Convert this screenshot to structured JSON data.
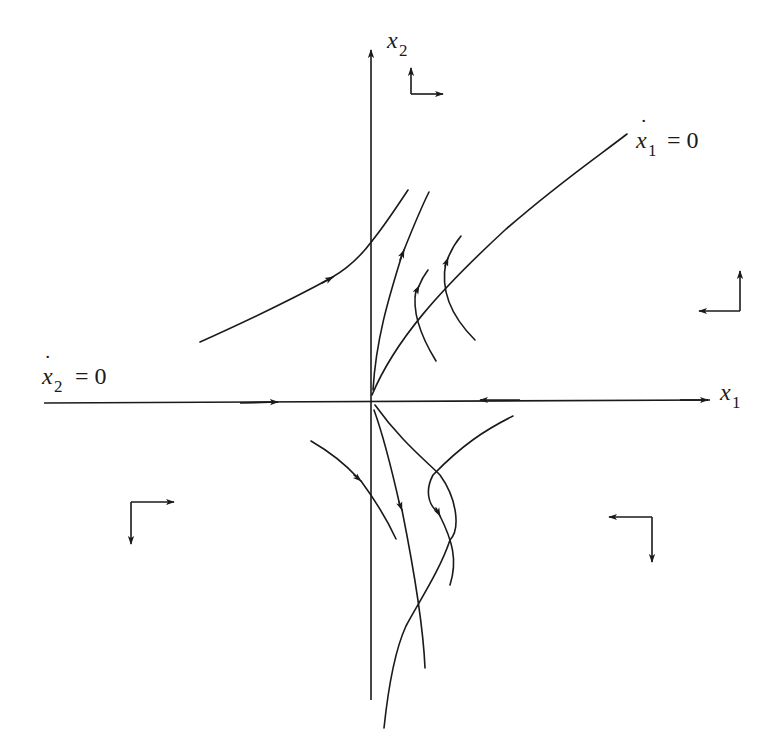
{
  "diagram": {
    "type": "phase-portrait",
    "ink_color": "#1a1a1a",
    "background": "#ffffff",
    "axes": {
      "x_label": {
        "var": "x",
        "sub": "1"
      },
      "y_label": {
        "var": "x",
        "sub": "2"
      }
    },
    "nullclines": [
      {
        "name": "x1-dot-nullcline",
        "var": "x",
        "sub": "1",
        "dot": true,
        "rhs": "= 0",
        "shape": "curve from origin to upper right"
      },
      {
        "name": "x2-dot-nullcline",
        "var": "x",
        "sub": "2",
        "dot": true,
        "rhs": "= 0",
        "shape": "negative x1 axis"
      }
    ],
    "direction_indicators": [
      {
        "region": "upper-middle",
        "vertical": "up",
        "horizontal": "right"
      },
      {
        "region": "right",
        "vertical": "up",
        "horizontal": "left"
      },
      {
        "region": "lower-left",
        "vertical": "down",
        "horizontal": "right"
      },
      {
        "region": "lower-right",
        "vertical": "down",
        "horizontal": "left"
      }
    ],
    "trajectories": [
      {
        "region": "upper-left",
        "direction": "toward upper right"
      },
      {
        "region": "upper",
        "direction": "up"
      },
      {
        "region": "upper",
        "direction": "up"
      },
      {
        "region": "upper",
        "direction": "up"
      },
      {
        "region": "lower-left",
        "direction": "down-right"
      },
      {
        "region": "lower",
        "direction": "down"
      },
      {
        "region": "lower-right",
        "direction": "down"
      }
    ]
  }
}
